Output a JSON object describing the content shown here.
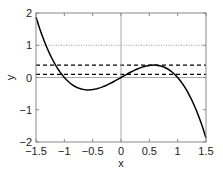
{
  "chart_data": {
    "type": "line",
    "title": "",
    "xlabel": "x",
    "ylabel": "y",
    "xlim": [
      -1.5,
      1.5
    ],
    "ylim": [
      -2,
      2
    ],
    "xticks": [
      -1.5,
      -1,
      -0.5,
      0,
      0.5,
      1,
      1.5
    ],
    "xtick_labels": [
      "−1.5",
      "−1",
      "−0.5",
      "0",
      "0.5",
      "1",
      "1.5"
    ],
    "yticks": [
      -2,
      -1,
      0,
      1,
      2
    ],
    "ytick_labels": [
      "−2",
      "−1",
      "0",
      "1",
      "2"
    ],
    "grid": false,
    "legend": null,
    "series": [
      {
        "name": "y = x - x^3",
        "style": "solid",
        "color": "#000000",
        "x": [
          -1.5,
          -1.25,
          -1.0,
          -0.75,
          -0.577,
          -0.5,
          -0.25,
          0,
          0.25,
          0.5,
          0.577,
          0.75,
          1.0,
          1.25,
          1.5
        ],
        "y": [
          1.875,
          0.703,
          0.0,
          -0.328,
          -0.385,
          -0.375,
          -0.234,
          0.0,
          0.234,
          0.375,
          0.385,
          0.328,
          0.0,
          -0.703,
          -1.875
        ]
      }
    ],
    "reference_lines": [
      {
        "orientation": "horizontal",
        "value": 1,
        "style": "dotted",
        "color": "#999999"
      },
      {
        "orientation": "horizontal",
        "value": 0.385,
        "style": "dashed",
        "color": "#000000"
      },
      {
        "orientation": "horizontal",
        "value": 0.1,
        "style": "dashed",
        "color": "#000000"
      },
      {
        "orientation": "horizontal",
        "value": 0,
        "style": "solid",
        "color": "#aaaaaa"
      },
      {
        "orientation": "vertical",
        "value": 0,
        "style": "solid",
        "color": "#aaaaaa"
      }
    ]
  }
}
